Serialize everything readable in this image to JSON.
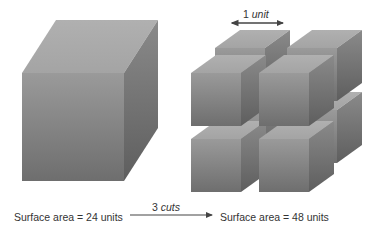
{
  "diagram": {
    "left_label": "Surface area = 24 units",
    "right_label": "Surface area = 48 units",
    "arrow_label_num": "3",
    "arrow_label_word": "cuts",
    "unit_label_num": "1",
    "unit_label_word": "unit",
    "colors": {
      "front_top": "#9a9a9a",
      "front_bottom": "#6e6e6e",
      "top_face": "#a8a8a8",
      "side_face_top": "#8a8a8a",
      "side_face_bottom": "#5e5e5e",
      "text": "#333333",
      "arrow": "#444444"
    },
    "big_cube": {
      "x": 22,
      "y": 73,
      "w": 102,
      "h": 108,
      "dx": 34,
      "dy": -53
    },
    "small_cube_size": {
      "w": 50,
      "h": 53,
      "dx": 25,
      "dy": -18
    },
    "small_cubes": [
      {
        "pos": "back-bottom-left",
        "x": 215,
        "y": 110
      },
      {
        "pos": "back-bottom-right",
        "x": 287,
        "y": 110
      },
      {
        "pos": "back-top-left",
        "x": 215,
        "y": 48
      },
      {
        "pos": "back-top-right",
        "x": 287,
        "y": 48
      },
      {
        "pos": "front-bottom-left",
        "x": 191,
        "y": 139
      },
      {
        "pos": "front-bottom-right",
        "x": 259,
        "y": 139
      },
      {
        "pos": "front-top-left",
        "x": 191,
        "y": 73
      },
      {
        "pos": "front-top-right",
        "x": 259,
        "y": 73
      }
    ],
    "unit_arrow": {
      "x1": 232,
      "x2": 283,
      "y": 23
    },
    "cut_arrow": {
      "x1": 130,
      "x2": 212,
      "y": 215
    }
  }
}
